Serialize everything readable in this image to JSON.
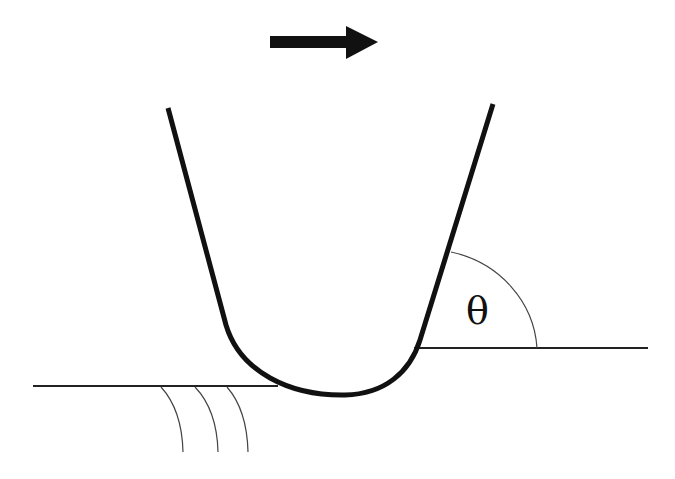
{
  "diagram": {
    "title": "",
    "labels": {
      "angle": "θ"
    },
    "elements": [
      {
        "id": "motion-arrow",
        "kind": "arrow",
        "direction": "right"
      },
      {
        "id": "u-shaped-tool",
        "kind": "curve",
        "description": "U-shaped indenter/probe profile"
      },
      {
        "id": "surface-left",
        "kind": "line",
        "description": "original surface (lower level, left)"
      },
      {
        "id": "surface-right",
        "kind": "line",
        "description": "surface after pile-up (higher level, right)"
      },
      {
        "id": "contact-angle-arc",
        "kind": "arc",
        "label": "θ"
      },
      {
        "id": "subsurface-lines",
        "kind": "arcs",
        "count": 3
      }
    ],
    "colors": {
      "stroke": "#111111",
      "thin_stroke": "#444444",
      "background": "#ffffff"
    }
  }
}
